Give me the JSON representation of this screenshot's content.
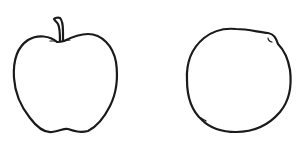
{
  "scene": {
    "description": "Line drawings of two fruits",
    "background": "#ffffff",
    "stroke_color": "#1a1a1a",
    "objects": [
      {
        "name": "apple",
        "label": "Apple outline with stem"
      },
      {
        "name": "orange",
        "label": "Round fruit outline (orange)"
      }
    ]
  }
}
